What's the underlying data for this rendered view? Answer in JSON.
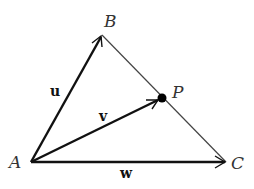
{
  "diagram": {
    "type": "vector-triangle",
    "points": {
      "A": {
        "label": "A",
        "x": 31,
        "y": 162
      },
      "B": {
        "label": "B",
        "x": 102,
        "y": 35
      },
      "C": {
        "label": "C",
        "x": 226,
        "y": 162
      },
      "P": {
        "label": "P",
        "x": 162,
        "y": 98
      }
    },
    "vectors": [
      {
        "name": "u",
        "label": "u",
        "from": "A",
        "to": "B"
      },
      {
        "name": "v",
        "label": "v",
        "from": "A",
        "to": "P"
      },
      {
        "name": "w",
        "label": "w",
        "from": "A",
        "to": "C"
      }
    ],
    "segments": [
      {
        "from": "B",
        "to": "C"
      }
    ],
    "colors": {
      "stroke": "#111111",
      "thin_stroke": "#444444",
      "label": "#333333"
    }
  }
}
